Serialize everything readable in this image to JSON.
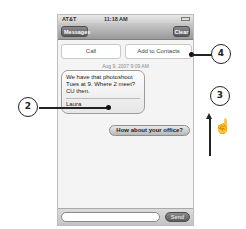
{
  "status_bar": {
    "carrier": "AT&T",
    "wifi_icon": "wifi-icon",
    "time": "11:18 AM",
    "battery_icon": "battery-icon"
  },
  "nav_bar": {
    "back_label": "Messages",
    "title": "",
    "clear_label": "Clear"
  },
  "actions": {
    "call_label": "Call",
    "add_contacts_label": "Add to Contacts"
  },
  "conversation": {
    "timestamp": "Aug 9, 2007 9:09 AM",
    "messages": [
      {
        "direction": "incoming",
        "text": "We have that photoshoot Tues at 9. Where 2 meet? CU then.",
        "signature": "Laura"
      },
      {
        "direction": "outgoing",
        "text": "How about your office?"
      }
    ]
  },
  "composer": {
    "input_value": "",
    "send_label": "Send"
  },
  "callouts": [
    {
      "number": "2",
      "target": "incoming message bubble"
    },
    {
      "number": "3",
      "target": "swipe up gesture"
    },
    {
      "number": "4",
      "target": "Add to Contacts button"
    }
  ],
  "gesture": {
    "arrow_icon": "arrow-up-icon",
    "hand_icon": "pointing-hand-icon"
  }
}
